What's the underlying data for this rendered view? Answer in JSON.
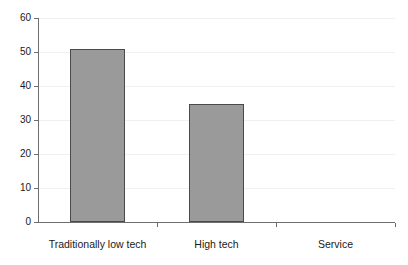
{
  "chart_data": {
    "type": "bar",
    "title": "",
    "xlabel": "",
    "ylabel": "",
    "categories": [
      "Traditionally low tech",
      "High tech",
      "Service"
    ],
    "values": [
      51,
      34.8,
      0
    ],
    "ylim": [
      0,
      60
    ],
    "yticks": [
      0,
      10,
      20,
      30,
      40,
      50,
      60
    ],
    "ytick_labels": [
      "0",
      "10",
      "20",
      "30",
      "40",
      "50",
      "60"
    ],
    "grid": true,
    "legend": false,
    "bar_color": "#9a9a9a",
    "bar_edge_color": "#4a4a4a",
    "axis_color": "#6e6e6e",
    "gridline_color": "#f0f0f0",
    "text_color": "#1a1a1a"
  }
}
